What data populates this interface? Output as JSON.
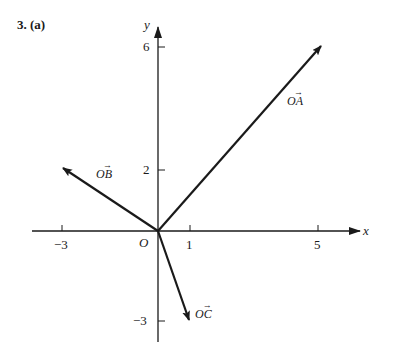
{
  "problem": {
    "number": "3.",
    "part": "(a)"
  },
  "axes": {
    "x_label": "x",
    "y_label": "y",
    "origin_label": "O",
    "x_ticks": [
      {
        "value": -3,
        "label": "−3"
      },
      {
        "value": 1,
        "label": "1"
      },
      {
        "value": 5,
        "label": "5"
      }
    ],
    "y_ticks": [
      {
        "value": 6,
        "label": "6"
      },
      {
        "value": 2,
        "label": "2"
      },
      {
        "value": -3,
        "label": "−3"
      }
    ]
  },
  "vectors": [
    {
      "name": "OA",
      "label_base": "OA",
      "tip": [
        5,
        6
      ]
    },
    {
      "name": "OB",
      "label_base": "OB",
      "tip": [
        -3,
        2
      ]
    },
    {
      "name": "OC",
      "label_base": "OC",
      "tip": [
        1,
        -3
      ]
    }
  ],
  "colors": {
    "ink": "#1a1a1a",
    "background": "#ffffff"
  }
}
